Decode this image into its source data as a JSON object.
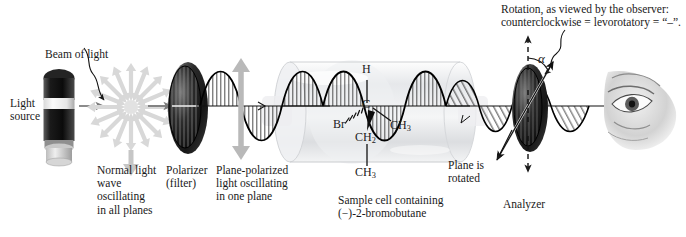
{
  "figure": {
    "type": "scientific-diagram"
  },
  "labels": {
    "beam_of_light": "Beam of light",
    "light_source": "Light\nsource",
    "normal_light": "Normal light\nwave\noscillating\nin all planes",
    "polarizer": "Polarizer\n(filter)",
    "plane_polarized": "Plane-polarized\nlight oscillating\nin one plane",
    "sample_cell": "Sample cell containing\n(−)-2-bromobutane",
    "plane_rotated": "Plane is\nrotated",
    "analyzer": "Analyzer",
    "rotation_note": "Rotation, as viewed by the observer:\ncounterclockwise = levorotatory = “–”.",
    "alpha_symbol": "α"
  },
  "molecule": {
    "name": "(−)-2-bromobutane",
    "center_atom": "C",
    "substituent_up": "H",
    "substituent_left": "Br",
    "substituent_right": "CH",
    "substituent_right_sub": "3",
    "substituent_down_1": "CH",
    "substituent_down_1_sub": "2",
    "substituent_down_2": "CH",
    "substituent_down_2_sub": "3"
  },
  "optics": {
    "polarization_plane": "vertical",
    "rotated_plane": "tilted counterclockwise",
    "rotation_sign": "−",
    "rotation_direction": "counterclockwise",
    "rotation_term": "levorotatory"
  },
  "colors": {
    "ink": "#1a1a1a",
    "wave_stroke": "#000000",
    "disc_dark": "#1c1c1c",
    "disc_mid": "#4a4a4a",
    "arrow_gray": "#b9b9b9",
    "star_gray": "#d8d8d8",
    "tube_glass": "#e9eaec",
    "background": "#ffffff",
    "beam_line": "#6f6f6f",
    "eye_skin": "#cfcfcf"
  },
  "icons": {
    "light_source": "lamp-icon",
    "unpolarized": "star-burst-icon",
    "polarizer": "polarizer-disc-icon",
    "analyzer": "analyzer-disc-icon",
    "observer": "eye-icon",
    "sample_cell": "glass-tube-icon"
  }
}
